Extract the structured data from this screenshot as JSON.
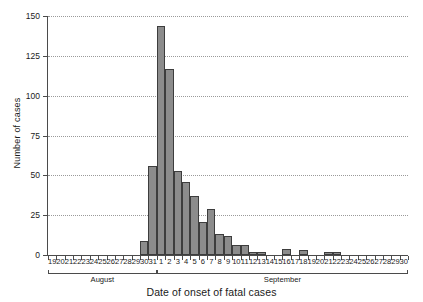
{
  "chart_data": {
    "type": "bar",
    "title": "",
    "xlabel": "Date of onset of fatal cases",
    "ylabel": "Number of cases",
    "ylim": [
      0,
      150
    ],
    "yticks": [
      0,
      25,
      50,
      75,
      100,
      125,
      150
    ],
    "ytick_labels": [
      "0",
      "25",
      "50",
      "75",
      "100",
      "125",
      "150"
    ],
    "grid": true,
    "legend": false,
    "bar_color": "#8c8c8c",
    "bar_edge_color": "#3d3d3d",
    "axis_color": "#4b4b4b",
    "gridline_color": "#9a9a9a",
    "categories": [
      "19",
      "20",
      "21",
      "22",
      "23",
      "24",
      "25",
      "26",
      "27",
      "28",
      "29",
      "30",
      "31",
      "1",
      "2",
      "3",
      "4",
      "5",
      "6",
      "7",
      "8",
      "9",
      "10",
      "11",
      "12",
      "13",
      "14",
      "15",
      "16",
      "17",
      "18",
      "19",
      "20",
      "21",
      "22",
      "23",
      "24",
      "25",
      "26",
      "27",
      "28",
      "29",
      "30"
    ],
    "values": [
      0,
      0,
      0,
      0,
      0,
      0,
      0,
      0,
      0,
      0,
      0,
      9,
      56,
      144,
      117,
      53,
      46,
      37,
      21,
      29,
      13,
      12,
      6,
      6,
      2,
      2,
      0,
      0,
      4,
      0,
      3,
      0,
      0,
      2,
      2,
      0,
      0,
      0,
      0,
      0,
      0,
      0,
      0
    ],
    "groups": [
      {
        "label": "August",
        "start_index": 0,
        "end_index": 12
      },
      {
        "label": "September",
        "start_index": 13,
        "end_index": 42
      }
    ]
  }
}
